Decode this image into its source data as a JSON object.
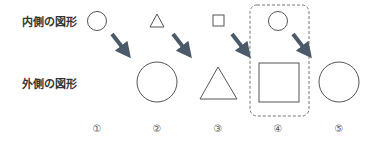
{
  "rows": {
    "inner_label": "内側の図形",
    "outer_label": "外側の図形"
  },
  "items": [
    {
      "number": "①",
      "inner": "circle",
      "outer": "none"
    },
    {
      "number": "②",
      "inner": "triangle",
      "outer": "circle"
    },
    {
      "number": "③",
      "inner": "square",
      "outer": "triangle"
    },
    {
      "number": "④",
      "inner": "circle",
      "outer": "square",
      "highlighted": true
    },
    {
      "number": "⑤",
      "inner": "none",
      "outer": "circle"
    }
  ],
  "colors": {
    "shape_stroke": "#555555",
    "arrow": "#4a5a68",
    "highlight_border": "#777777"
  }
}
